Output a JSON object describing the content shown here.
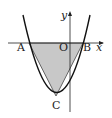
{
  "diagram": {
    "labels": {
      "A": "A",
      "B": "B",
      "C": "C",
      "O": "O",
      "x_axis": "x",
      "y_axis": "y"
    },
    "points": {
      "A": [
        29,
        43
      ],
      "B": [
        83,
        43
      ],
      "C": [
        56,
        96
      ],
      "O": [
        70,
        43
      ]
    },
    "colors": {
      "fill": "#c8c8c8",
      "stroke": "#222222"
    }
  }
}
